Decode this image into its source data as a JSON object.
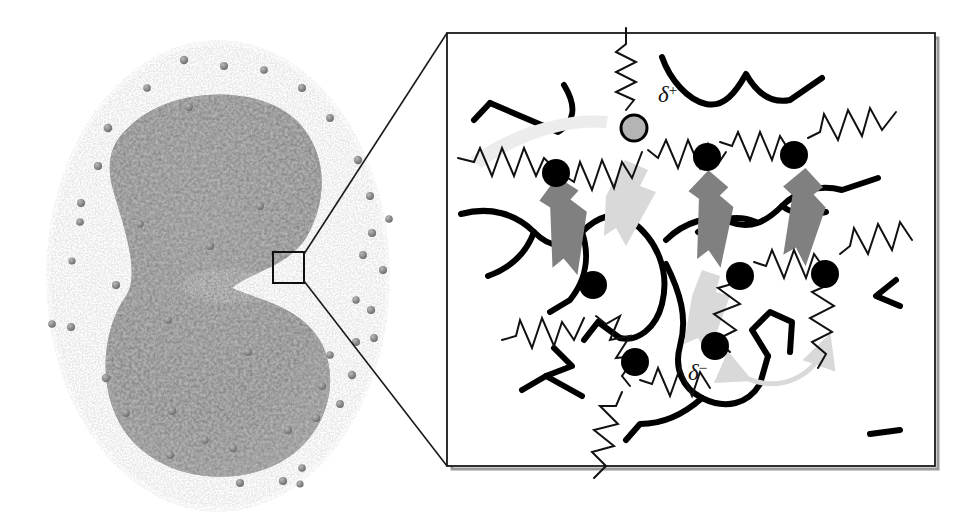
{
  "figure": {
    "background_color": "#ffffff",
    "width": 972,
    "height": 526
  },
  "left_panel": {
    "name": "simulation-snapshot",
    "description": "Molecular dynamics snapshot of a spherical polymer nanodroplet with a dense gray core and a diffuse corona of chain filaments, plus scattered counter-ion spheres.",
    "core_color": "#7d7d7d",
    "corona_color": "#bfbfbf",
    "ion_color": "#8a8a8a",
    "droplet_center": [
      218,
      276
    ],
    "droplet_radius_x": 172,
    "droplet_radius_y": 236,
    "core_radius_x": 110,
    "core_radius_y": 170,
    "roi_box": {
      "label": "region-of-interest",
      "x": 273,
      "y": 252,
      "width": 31,
      "height": 31,
      "stroke": "#101010"
    }
  },
  "zoom_leaders": {
    "name": "magnification-leader-lines",
    "stroke": "#1a1a1a",
    "upper": {
      "x1": 304,
      "y1": 254,
      "x2": 447,
      "y2": 33
    },
    "lower": {
      "x1": 304,
      "y1": 281,
      "x2": 447,
      "y2": 466
    }
  },
  "right_panel": {
    "name": "magnified-schematic",
    "frame": {
      "x": 447,
      "y": 33,
      "width": 488,
      "height": 433,
      "stroke": "#1a1a1a",
      "shadow": "#9a9a9a"
    },
    "legend_notes": {
      "chain": "thick black curve = polymer backbone",
      "spring": "zigzag = harmonic bond / elastic link",
      "bead_neutral": "filled black circle = charged monomer bead",
      "bead_positive": "gray filled circle = partially positive site",
      "arrow_dark": "dark gray double arrow = dipolar attraction",
      "arrow_light": "light gray arrow = ion / chain migration"
    },
    "colors": {
      "chain": "#000000",
      "spring": "#111111",
      "bead": "#000000",
      "bead_positive_fill": "#b4b4b4",
      "arrow_dark": "#808080",
      "arrow_light": "#d6d6d6"
    },
    "labels": [
      {
        "name": "delta-plus-label",
        "symbol": "δ",
        "superscript": "+",
        "x": 659,
        "y": 127
      },
      {
        "name": "delta-minus-label",
        "symbol": "δ",
        "superscript": "−",
        "x": 690,
        "y": 386
      }
    ],
    "beads": [
      {
        "id": "b1",
        "cx": 634,
        "y": 140,
        "cy": 140,
        "r": 11,
        "type": "positive"
      },
      {
        "id": "b2",
        "cx": 556,
        "cy": 182,
        "r": 12,
        "type": "negative"
      },
      {
        "id": "b3",
        "cx": 707,
        "cy": 168,
        "r": 12,
        "type": "negative"
      },
      {
        "id": "b4",
        "cx": 794,
        "cy": 167,
        "r": 12,
        "type": "negative"
      },
      {
        "id": "b5",
        "cx": 593,
        "cy": 296,
        "r": 12,
        "type": "negative"
      },
      {
        "id": "b6",
        "cx": 740,
        "cy": 287,
        "r": 12,
        "type": "negative"
      },
      {
        "id": "b7",
        "cx": 825,
        "cy": 285,
        "r": 12,
        "type": "negative"
      },
      {
        "id": "b8",
        "cx": 635,
        "cy": 373,
        "r": 12,
        "type": "negative"
      },
      {
        "id": "b9",
        "cx": 715,
        "cy": 357,
        "r": 12,
        "type": "negative"
      }
    ],
    "interaction_arrows": [
      {
        "name": "dipole-arrow-left",
        "x": 572,
        "y": 205,
        "angle": -22,
        "length": 96,
        "tone": "dark"
      },
      {
        "name": "dipole-arrow-center",
        "x": 715,
        "y": 200,
        "angle": 2,
        "length": 92,
        "tone": "dark"
      },
      {
        "name": "dipole-arrow-right",
        "x": 818,
        "y": 200,
        "angle": 4,
        "length": 92,
        "tone": "dark"
      },
      {
        "name": "migration-arrow-upper",
        "x": 635,
        "y": 205,
        "angle": 28,
        "length": 96,
        "tone": "light"
      },
      {
        "name": "migration-arrow-lower",
        "x": 700,
        "y": 300,
        "angle": 20,
        "length": 96,
        "tone": "light"
      }
    ]
  }
}
